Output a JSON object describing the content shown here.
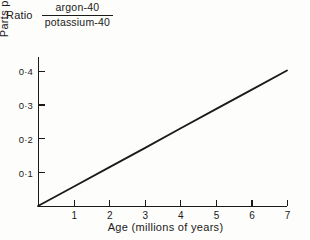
{
  "figure": {
    "ratio_word": "Ratio",
    "numerator": "argon-40",
    "denominator": "potassium-40"
  },
  "chart_data": {
    "type": "line",
    "xlabel": "Age (millions of years)",
    "ylabel": "Parts per thousand",
    "xlim": [
      0,
      7
    ],
    "ylim": [
      0,
      0.44
    ],
    "grid": false,
    "legend": null,
    "xticks": [
      1,
      2,
      3,
      4,
      5,
      6,
      7
    ],
    "xtick_labels": [
      "1",
      "2",
      "3",
      "4",
      "5",
      "6",
      "7"
    ],
    "yticks": [
      0.1,
      0.2,
      0.3,
      0.4
    ],
    "ytick_labels": [
      "0·1",
      "0·2",
      "0·3",
      "0·4"
    ],
    "series": [
      {
        "name": "argon-40 / potassium-40 ratio",
        "color": "#1a1a1a",
        "x": [
          0,
          1,
          2,
          3,
          4,
          5,
          6,
          7
        ],
        "values": [
          0.0,
          0.057,
          0.114,
          0.171,
          0.229,
          0.286,
          0.343,
          0.4
        ]
      }
    ]
  }
}
